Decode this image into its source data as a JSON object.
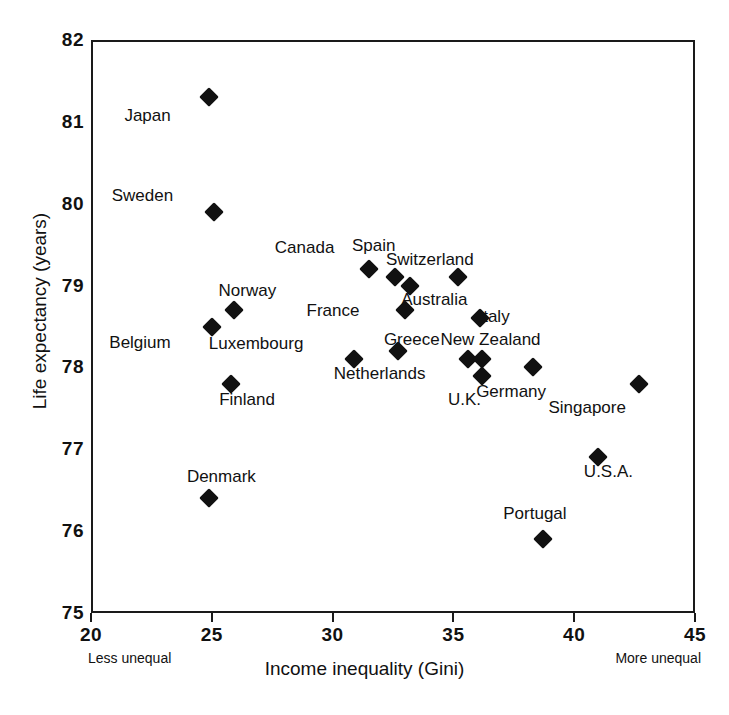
{
  "chart_data": {
    "type": "scatter",
    "title": "",
    "xlabel": "Income inequality (Gini)",
    "ylabel": "Life expectancy (years)",
    "xlim": [
      20,
      45
    ],
    "ylim": [
      75,
      82
    ],
    "xticks": [
      20,
      25,
      30,
      35,
      40,
      45
    ],
    "yticks": [
      75,
      76,
      77,
      78,
      79,
      80,
      81,
      82
    ],
    "grid": false,
    "legend": null,
    "x_axis_left_note": "Less unequal",
    "x_axis_right_note": "More unequal",
    "points": [
      {
        "label": "Japan",
        "x": 24.9,
        "y": 81.3,
        "label_dx": -62,
        "label_dy": 18
      },
      {
        "label": "Sweden",
        "x": 25.1,
        "y": 79.9,
        "label_dx": -72,
        "label_dy": -16
      },
      {
        "label": "Belgium",
        "x": 25.0,
        "y": 78.5,
        "label_dx": -72,
        "label_dy": 16
      },
      {
        "label": "Norway",
        "x": 25.9,
        "y": 78.7,
        "label_dx": 14,
        "label_dy": -20
      },
      {
        "label": "Finland",
        "x": 25.8,
        "y": 77.8,
        "label_dx": 16,
        "label_dy": 16
      },
      {
        "label": "Denmark",
        "x": 24.9,
        "y": 76.4,
        "label_dx": 12,
        "label_dy": -22
      },
      {
        "label": "Luxembourg",
        "x": 30.9,
        "y": 78.1,
        "label_dx": -98,
        "label_dy": -16
      },
      {
        "label": "Canada",
        "x": 31.5,
        "y": 79.2,
        "label_dx": -64,
        "label_dy": -22
      },
      {
        "label": "Spain",
        "x": 32.6,
        "y": 79.1,
        "label_dx": -22,
        "label_dy": -32
      },
      {
        "label": "France",
        "x": 33.0,
        "y": 78.7,
        "label_dx": -72,
        "label_dy": 0
      },
      {
        "label": "Switzerland",
        "x": 33.2,
        "y": 79.0,
        "label_dx": 20,
        "label_dy": -26
      },
      {
        "label": "Netherlands",
        "x": 32.7,
        "y": 78.2,
        "label_dx": -18,
        "label_dy": 22
      },
      {
        "label": "Australia",
        "x": 35.2,
        "y": 79.1,
        "label_dx": -24,
        "label_dy": 22
      },
      {
        "label": "Greece",
        "x": 35.6,
        "y": 78.1,
        "label_dx": -56,
        "label_dy": -20
      },
      {
        "label": "Italy",
        "x": 36.1,
        "y": 78.6,
        "label_dx": 14,
        "label_dy": -2
      },
      {
        "label": "New Zealand",
        "x": 36.2,
        "y": 78.1,
        "label_dx": 8,
        "label_dy": -20
      },
      {
        "label": "U.K.",
        "x": 36.2,
        "y": 77.9,
        "label_dx": -18,
        "label_dy": 24
      },
      {
        "label": "Germany",
        "x": 38.3,
        "y": 78.0,
        "label_dx": -22,
        "label_dy": 24
      },
      {
        "label": "Singapore",
        "x": 42.7,
        "y": 77.8,
        "label_dx": -52,
        "label_dy": 24
      },
      {
        "label": "U.S.A.",
        "x": 41.0,
        "y": 76.9,
        "label_dx": 10,
        "label_dy": 14
      },
      {
        "label": "Portugal",
        "x": 38.7,
        "y": 75.9,
        "label_dx": -8,
        "label_dy": -26
      }
    ]
  }
}
